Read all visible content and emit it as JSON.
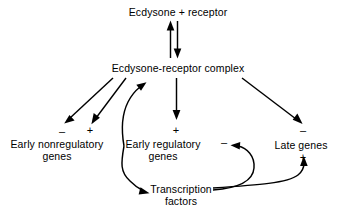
{
  "diagram": {
    "background_color": "#ffffff",
    "line_color": "#000000",
    "text_color": "#000000",
    "nodes": [
      {
        "id": "ecdysone-receptor",
        "label": "Ecdysone + receptor",
        "x": 178,
        "y": 12
      },
      {
        "id": "ecdysone-receptor-complex",
        "label": "Ecdysone-receptor complex",
        "x": 178,
        "y": 68
      },
      {
        "id": "early-nonregulatory-genes",
        "label": "Early nonregulatory\ngenes",
        "x": 57,
        "y": 150
      },
      {
        "id": "early-regulatory-genes",
        "label": "Early regulatory\ngenes",
        "x": 163,
        "y": 150
      },
      {
        "id": "late-genes",
        "label": "Late genes",
        "x": 301,
        "y": 145
      },
      {
        "id": "transcription-factors",
        "label": "Transcription\nfactors",
        "x": 181,
        "y": 190
      }
    ],
    "signs": [
      {
        "id": "sign-early-nonregulatory-negative",
        "symbol": "–",
        "x": 62,
        "y": 130
      },
      {
        "id": "sign-early-nonregulatory-positive",
        "symbol": "+",
        "x": 90,
        "y": 129
      },
      {
        "id": "sign-early-regulatory-positive",
        "symbol": "+",
        "x": 176,
        "y": 129
      },
      {
        "id": "sign-early-regulatory-negative",
        "symbol": "–",
        "x": 224,
        "y": 141
      },
      {
        "id": "sign-late-genes-negative",
        "symbol": "–",
        "x": 303,
        "y": 129
      },
      {
        "id": "sign-late-genes-positive",
        "symbol": "+",
        "x": 303,
        "y": 155
      }
    ],
    "edges": [
      {
        "id": "edge-receptor-to-complex-up",
        "from": "ecdysone-receptor-complex",
        "to": "ecdysone-receptor",
        "kind": "straight",
        "direction": "up"
      },
      {
        "id": "edge-receptor-to-complex-down",
        "from": "ecdysone-receptor",
        "to": "ecdysone-receptor-complex",
        "kind": "straight",
        "direction": "down"
      },
      {
        "id": "edge-complex-to-nonregulatory-neg",
        "from": "ecdysone-receptor-complex",
        "to": "early-nonregulatory-genes",
        "kind": "straight",
        "sign": "–"
      },
      {
        "id": "edge-complex-to-nonregulatory-pos",
        "from": "ecdysone-receptor-complex",
        "to": "early-nonregulatory-genes",
        "kind": "straight",
        "sign": "+"
      },
      {
        "id": "edge-complex-to-early-regulatory",
        "from": "ecdysone-receptor-complex",
        "to": "early-regulatory-genes",
        "kind": "straight",
        "sign": "+"
      },
      {
        "id": "edge-complex-to-late-genes",
        "from": "ecdysone-receptor-complex",
        "to": "late-genes",
        "kind": "straight",
        "sign": "–"
      },
      {
        "id": "edge-early-regulatory-to-factors",
        "from": "early-regulatory-genes",
        "to": "transcription-factors",
        "kind": "curved"
      },
      {
        "id": "edge-factors-to-complex",
        "from": "transcription-factors",
        "to": "ecdysone-receptor-complex",
        "kind": "curved"
      },
      {
        "id": "edge-factors-to-early-regulatory",
        "from": "transcription-factors",
        "to": "early-regulatory-genes",
        "kind": "curved",
        "sign": "–"
      },
      {
        "id": "edge-factors-to-late-genes",
        "from": "transcription-factors",
        "to": "late-genes",
        "kind": "curved",
        "sign": "+"
      }
    ]
  }
}
